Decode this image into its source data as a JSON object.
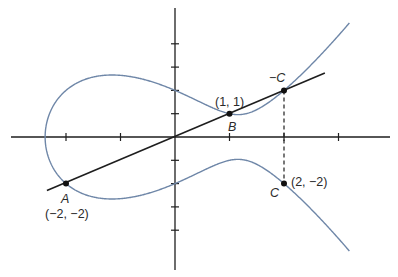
{
  "diagram": {
    "type": "elliptic-curve-point-addition",
    "equation": "y^2 = x^3 - 4x + 4",
    "curve": {
      "a": -4,
      "b": 4,
      "x_max": 3.2,
      "color": "#6f87a8"
    },
    "axes": {
      "x_ticks": [
        -2,
        -1,
        1,
        2,
        3
      ],
      "y_ticks": [
        -4,
        -3,
        -2,
        -1,
        1,
        2,
        3,
        4
      ],
      "color": "#1e1e1e"
    },
    "line": {
      "from": [
        -2.35,
        -2.3
      ],
      "to": [
        2.75,
        2.75
      ],
      "color": "#1e1e1e"
    },
    "dashed_line": {
      "from": [
        2,
        2
      ],
      "to": [
        2,
        -2
      ]
    },
    "points": [
      {
        "name": "A",
        "label": "A",
        "coord_label": "(−2, −2)",
        "x": -2,
        "y": -2
      },
      {
        "name": "B",
        "label": "B",
        "coord_label": "(1, 1)",
        "x": 1,
        "y": 1
      },
      {
        "name": "neg-C",
        "label": "−C",
        "coord_label": "",
        "x": 2,
        "y": 2
      },
      {
        "name": "C",
        "label": "C",
        "coord_label": "(2, −2)",
        "x": 2,
        "y": -2
      }
    ]
  }
}
